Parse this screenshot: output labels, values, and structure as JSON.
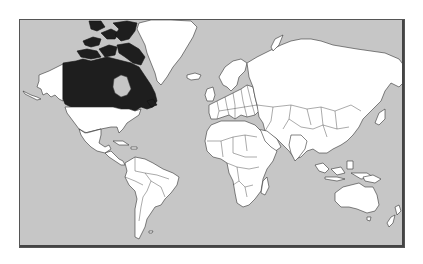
{
  "map": {
    "title": "World map",
    "projection": "Mercator",
    "highlighted_country": "Canada",
    "colors": {
      "ocean": "#c6c6c6",
      "land": "#ffffff",
      "highlight": "#1e1e1e",
      "borders": "#333333",
      "page_background": "#ffffff"
    }
  }
}
